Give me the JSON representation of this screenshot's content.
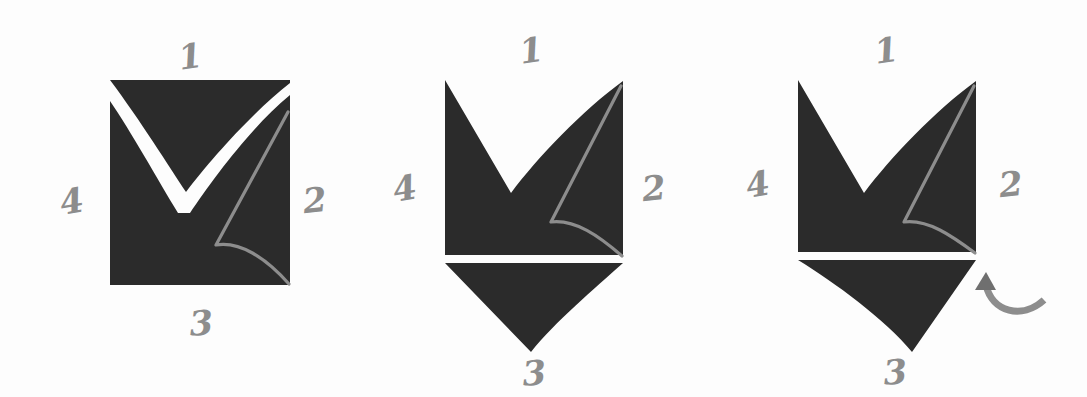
{
  "figure": {
    "background_color": "#fdfdfd",
    "tile_color": "#2b2b2b",
    "annotation_color": "#8d8d8d",
    "panel_count": 3
  },
  "labels": {
    "edge_top": "1",
    "edge_right": "2",
    "edge_bottom": "3",
    "edge_left": "4"
  },
  "panels": [
    {
      "id": "panel-1",
      "name": "original-square-tile",
      "labels": {
        "top": "1",
        "right": "2",
        "bottom": "3",
        "left": "4"
      },
      "has_rotation_arrow": false,
      "bottom_flap": "none",
      "top_notch": "white-check-inside",
      "description": "Square tile with a white curved check-shaped band cut across the top and a gray curve from the top-right corner to the bottom-right corner."
    },
    {
      "id": "panel-2",
      "name": "tile-with-notch-and-flap",
      "labels": {
        "top": "1",
        "right": "2",
        "bottom": "3",
        "left": "4"
      },
      "has_rotation_arrow": false,
      "bottom_flap": "triangle-straight-left-curved-right",
      "top_notch": "v-notch-removed",
      "description": "The check band is removed from the top leaving a V notch; the matching triangular flap is attached below the bottom edge, separated by a thin white gap."
    },
    {
      "id": "panel-3",
      "name": "tile-with-rotated-flap",
      "labels": {
        "top": "1",
        "right": "2",
        "bottom": "3",
        "left": "4"
      },
      "has_rotation_arrow": true,
      "bottom_flap": "triangle-curved-left-straight-right",
      "top_notch": "v-notch-removed",
      "description": "Same as panel 2 but the lower triangular flap has been rotated, indicated by a curved counter-clockwise arrow at its lower-right."
    }
  ],
  "rotation_arrow": {
    "name": "rotate-arrow",
    "direction": "counter-clockwise",
    "color": "#8d8d8d"
  }
}
